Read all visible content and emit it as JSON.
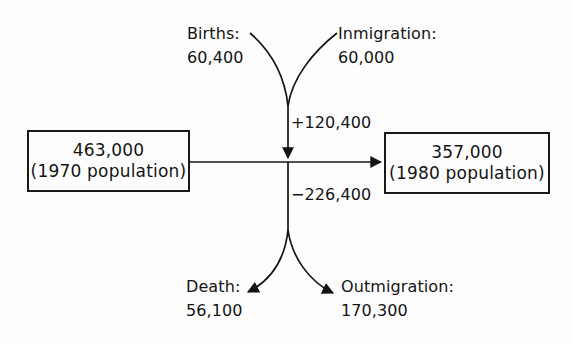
{
  "diagram": {
    "type": "population-flow-diagram",
    "boxes": [
      {
        "id": "box-1970",
        "value": "463,000",
        "caption": "(1970 population)"
      },
      {
        "id": "box-1980",
        "value": "357,000",
        "caption": "(1980 population)"
      }
    ],
    "inflows": [
      {
        "id": "births",
        "name": "Births:",
        "quantity": "60,400"
      },
      {
        "id": "inmigration",
        "name": "Inmigration:",
        "quantity": "60,000"
      }
    ],
    "outflows": [
      {
        "id": "death",
        "name": "Death:",
        "quantity": "56,100"
      },
      {
        "id": "outmigration",
        "name": "Outmigration:",
        "quantity": "170,300"
      }
    ],
    "net": {
      "gain": "+120,400",
      "loss": "−226,400"
    },
    "colors": {
      "background": "#fdfdfd",
      "ink": "#141414",
      "box_border": "#1a1a1a"
    }
  }
}
